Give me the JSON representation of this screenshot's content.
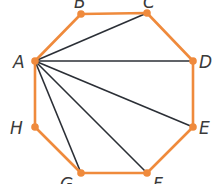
{
  "diagram": {
    "type": "octagon-diagonals",
    "edge_color": "#ef8a3c",
    "diagonal_color": "#2b2f36",
    "vertices": [
      {
        "label": "A",
        "x": 35,
        "y": 61,
        "lx": 13,
        "ly": 68
      },
      {
        "label": "B",
        "x": 81,
        "y": 14,
        "lx": 74,
        "ly": 8
      },
      {
        "label": "C",
        "x": 147,
        "y": 13,
        "lx": 143,
        "ly": 8
      },
      {
        "label": "D",
        "x": 193,
        "y": 61,
        "lx": 199,
        "ly": 68
      },
      {
        "label": "E",
        "x": 193,
        "y": 127,
        "lx": 199,
        "ly": 134
      },
      {
        "label": "F",
        "x": 147,
        "y": 173,
        "lx": 153,
        "ly": 190
      },
      {
        "label": "G",
        "x": 81,
        "y": 173,
        "lx": 60,
        "ly": 190
      },
      {
        "label": "H",
        "x": 35,
        "y": 127,
        "lx": 10,
        "ly": 134
      }
    ],
    "diagonals_from": "A",
    "diagonals_to": [
      "C",
      "D",
      "E",
      "F",
      "G"
    ]
  }
}
